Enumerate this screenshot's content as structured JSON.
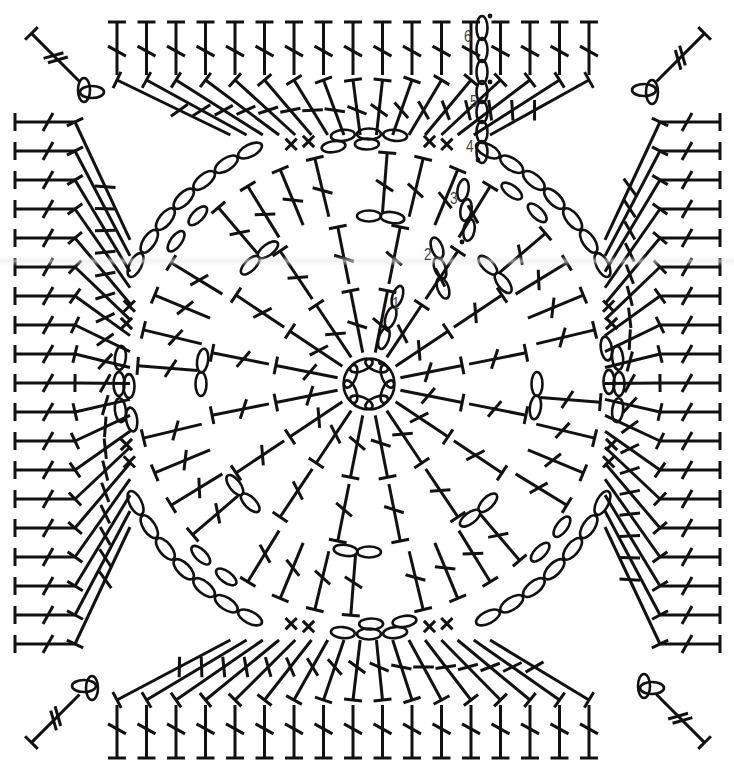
{
  "diagram": {
    "type": "crochet-chart",
    "width": 734,
    "height": 780,
    "center": [
      369,
      384
    ],
    "ink_color": "#111111",
    "label_color": "#444444",
    "background": "#ffffff",
    "round_labels": [
      {
        "text": "1",
        "x": 392,
        "y": 305
      },
      {
        "text": "2",
        "x": 424,
        "y": 256
      },
      {
        "text": "3",
        "x": 450,
        "y": 200
      },
      {
        "text": "4",
        "x": 466,
        "y": 148
      },
      {
        "text": "5",
        "x": 470,
        "y": 103
      },
      {
        "text": "6",
        "x": 464,
        "y": 38
      }
    ],
    "symbols": {
      "chain": "ellipse (ch)",
      "slip_stitch": "dot (sl st)",
      "single_crochet": "plus (sc)",
      "double_crochet": "T with one bar (dc)",
      "treble_crochet": "T with two bars (tr)"
    },
    "rounds": [
      {
        "round": 1,
        "start_ring_chains": 8,
        "stitches": "dc",
        "count": 16,
        "radius_from": 30,
        "radius_to": 165
      },
      {
        "round": 2,
        "stitches": "dc groups + ch",
        "radius": 165
      },
      {
        "round": 3,
        "stitches": "dc fans + ch",
        "radius": 235
      },
      {
        "round": 4,
        "stitches": "ch corners + sc",
        "radius": 250
      },
      {
        "round": 5,
        "stitches": "dc",
        "per_side": 20
      },
      {
        "round": 6,
        "stitches": "dc",
        "per_side": 22,
        "corner": "tr"
      }
    ]
  }
}
